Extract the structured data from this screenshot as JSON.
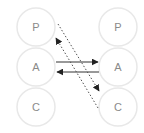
{
  "diagram": {
    "type": "transactional-analysis-crossed-transaction",
    "left_person": {
      "states": [
        {
          "label": "P",
          "cx": 36,
          "cy": 27
        },
        {
          "label": "A",
          "cx": 36,
          "cy": 67
        },
        {
          "label": "C",
          "cx": 36,
          "cy": 107
        }
      ]
    },
    "right_person": {
      "states": [
        {
          "label": "P",
          "cx": 118,
          "cy": 27
        },
        {
          "label": "A",
          "cx": 118,
          "cy": 67
        },
        {
          "label": "C",
          "cx": 118,
          "cy": 107
        }
      ]
    },
    "radius": 19,
    "arrows": [
      {
        "name": "adult-to-adult",
        "style": "solid",
        "from": [
          56,
          62
        ],
        "to": [
          98,
          62
        ]
      },
      {
        "name": "adult-to-adult-return",
        "style": "solid",
        "from": [
          99,
          72
        ],
        "to": [
          57,
          72
        ]
      },
      {
        "name": "parent-to-child",
        "style": "dotted",
        "from": [
          58,
          24
        ],
        "to": [
          99,
          91
        ]
      },
      {
        "name": "child-to-parent",
        "style": "dotted",
        "from": [
          98,
          108
        ],
        "to": [
          56,
          38
        ]
      }
    ],
    "colors": {
      "circle_stroke": "#e8e8e8",
      "label": "#8a8a8a",
      "arrow": "#333333"
    }
  }
}
